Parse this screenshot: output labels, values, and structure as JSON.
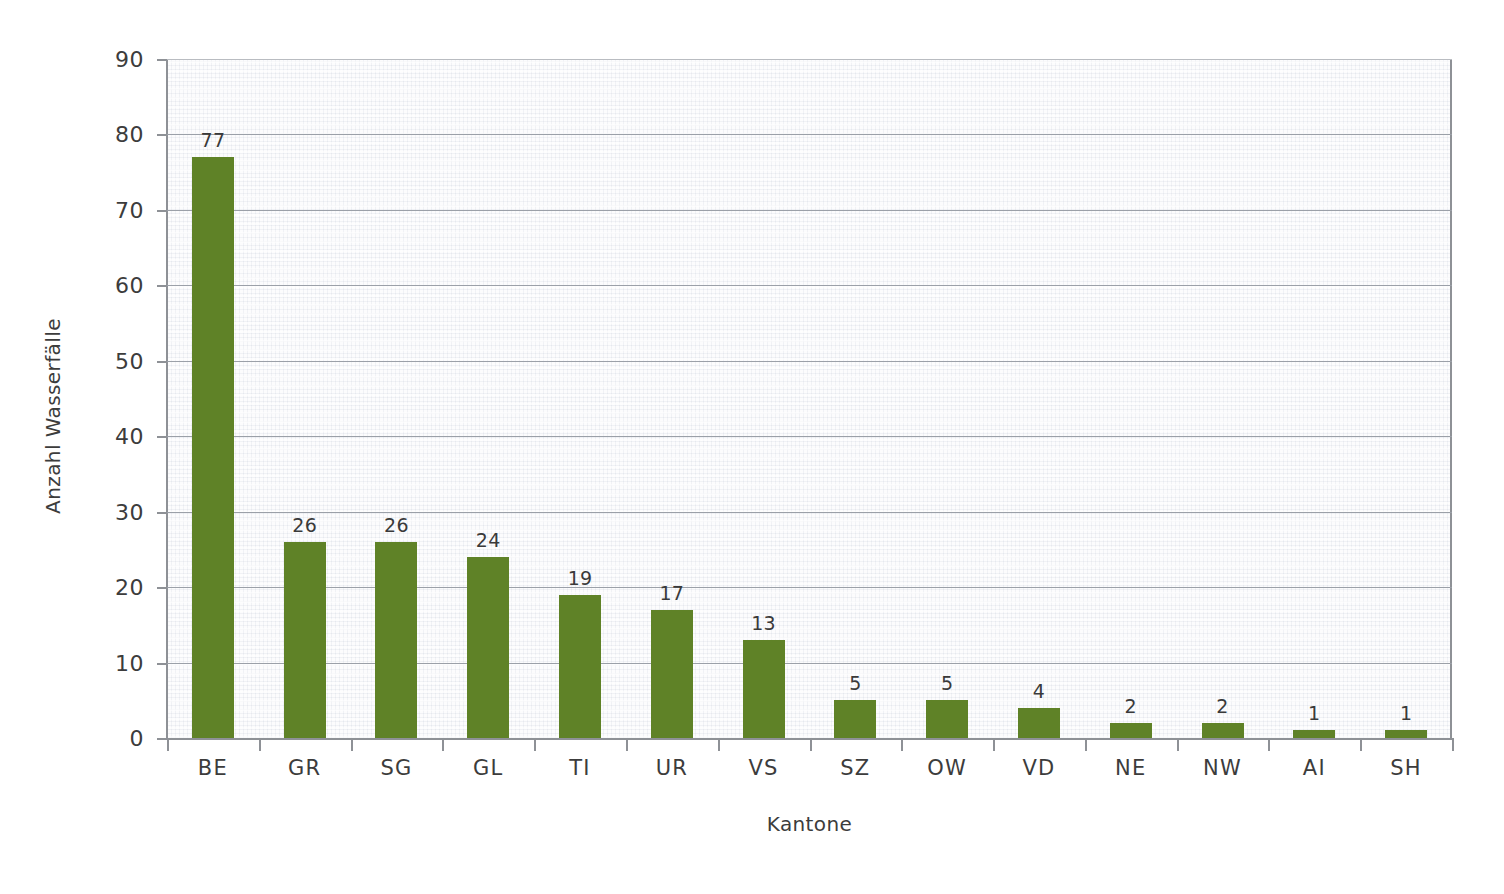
{
  "chart_data": {
    "type": "bar",
    "title": "",
    "xlabel": "Kantone",
    "ylabel": "Anzahl Wasserfälle",
    "categories": [
      "BE",
      "GR",
      "SG",
      "GL",
      "TI",
      "UR",
      "VS",
      "SZ",
      "OW",
      "VD",
      "NE",
      "NW",
      "AI",
      "SH"
    ],
    "values": [
      77,
      26,
      26,
      24,
      19,
      17,
      13,
      5,
      5,
      4,
      2,
      2,
      1,
      1
    ],
    "ylim": [
      0,
      90
    ],
    "ytick_labels": [
      "90",
      "80",
      "70",
      "60",
      "50",
      "40",
      "30",
      "20",
      "10",
      "0"
    ],
    "ytick_values": [
      90,
      80,
      70,
      60,
      50,
      40,
      30,
      20,
      10,
      0
    ],
    "grid": "horizontal",
    "legend": "none",
    "bar_color": "#5f8227",
    "gridline_color": "#9ba0a8",
    "axis_color": "#8e9196",
    "text_color": "#3c3c3c",
    "plot_background": "#fcfcfd"
  }
}
